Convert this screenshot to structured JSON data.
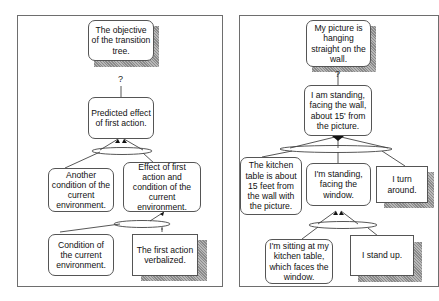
{
  "left_tree": {
    "title_hint": "Generic transition tree template",
    "objective": "The objective of the transition tree.",
    "question_mark": "?",
    "predicted_effect": "Predicted effect of first action.",
    "another_condition": "Another condition of the current environment.",
    "effect_and_condition": "Effect of first action and condition of the current environment.",
    "condition": "Condition of the current environment.",
    "first_action": "The first action verbalized."
  },
  "right_tree": {
    "title_hint": "Example transition tree",
    "objective": "My picture is hanging straight on the wall.",
    "question_mark": "?",
    "standing_facing_wall": "I am standing, facing the wall, about 15' from the picture.",
    "kitchen_table_distance": "The kitchen table is about 15 feet from the wall with the picture.",
    "standing_facing_window": "I'm standing, facing the window.",
    "turn_around": "I turn around.",
    "sitting_at_table": "I'm sitting at my kitchen table, which faces the window.",
    "stand_up": "I stand up."
  },
  "colors": {
    "border": "#555555",
    "panel_border": "#6e6e6e",
    "shadow": "#9a9a9a"
  }
}
